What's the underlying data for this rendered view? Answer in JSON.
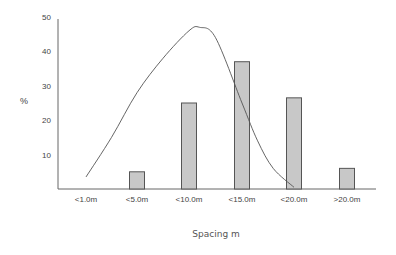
{
  "chart_data": {
    "type": "bar",
    "title": "",
    "xlabel": "Spacing m",
    "ylabel": "%",
    "ylim": [
      0,
      50
    ],
    "yticks": [
      10,
      20,
      30,
      40,
      50
    ],
    "grid": false,
    "legend": null,
    "categories": [
      "<1.0m",
      "<5.0m",
      "<10.0m",
      "<15.0m",
      "<20.0m",
      ">20.0m"
    ],
    "series": [
      {
        "name": "Observed",
        "type": "bar",
        "values": [
          0,
          5,
          25,
          37,
          26.5,
          6
        ]
      },
      {
        "name": "Fitted distribution",
        "type": "line",
        "points": [
          [
            0,
            3.5
          ],
          [
            0.5,
            15
          ],
          [
            1,
            28
          ],
          [
            1.5,
            38
          ],
          [
            2,
            46
          ],
          [
            2.2,
            47
          ],
          [
            2.5,
            44
          ],
          [
            3,
            25
          ],
          [
            3.3,
            14
          ],
          [
            3.6,
            6
          ],
          [
            4,
            0.5
          ]
        ]
      }
    ]
  },
  "colors": {
    "bar_fill": "#c8c8c8",
    "bar_stroke": "#555555",
    "axis": "#666666",
    "curve": "#555555"
  }
}
